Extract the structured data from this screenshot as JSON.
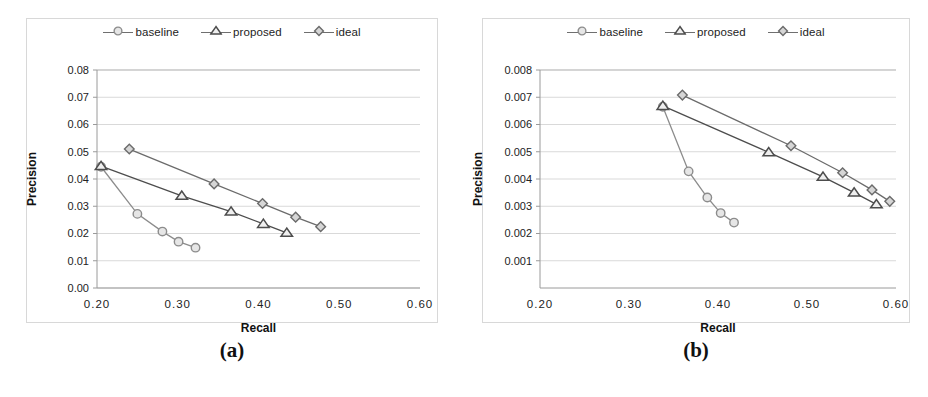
{
  "figure": {
    "panels": [
      {
        "caption": "(a)",
        "legend": [
          {
            "label": "baseline",
            "marker": "circle",
            "color": "#8c8c8c"
          },
          {
            "label": "proposed",
            "marker": "triangle",
            "color": "#4d4d4d"
          },
          {
            "label": "ideal",
            "marker": "diamond",
            "color": "#6b6b6b"
          }
        ],
        "chart_data": {
          "type": "line",
          "title": "",
          "xlabel": "Recall",
          "ylabel": "Precision",
          "xlim": [
            0.2,
            0.6
          ],
          "ylim": [
            0.0,
            0.08
          ],
          "xticks": [
            "0.20",
            "0.30",
            "0.40",
            "0.50",
            "0.60"
          ],
          "xtick_values": [
            0.2,
            0.3,
            0.4,
            0.5,
            0.6
          ],
          "yticks": [
            "0.00",
            "0.01",
            "0.02",
            "0.03",
            "0.04",
            "0.05",
            "0.06",
            "0.07",
            "0.08"
          ],
          "ytick_values": [
            0.0,
            0.01,
            0.02,
            0.03,
            0.04,
            0.05,
            0.06,
            0.07,
            0.08
          ],
          "grid": "horizontal",
          "legend_position": "top-center",
          "series": [
            {
              "name": "baseline",
              "marker": "circle",
              "color": "#8c8c8c",
              "x": [
                0.205,
                0.25,
                0.281,
                0.301,
                0.322
              ],
              "y": [
                0.0445,
                0.0272,
                0.0207,
                0.017,
                0.0148
              ]
            },
            {
              "name": "proposed",
              "marker": "triangle",
              "color": "#4d4d4d",
              "x": [
                0.205,
                0.305,
                0.366,
                0.406,
                0.435
              ],
              "y": [
                0.0447,
                0.0338,
                0.028,
                0.0235,
                0.0202
              ]
            },
            {
              "name": "ideal",
              "marker": "diamond",
              "color": "#6b6b6b",
              "x": [
                0.24,
                0.345,
                0.405,
                0.446,
                0.477
              ],
              "y": [
                0.051,
                0.0382,
                0.031,
                0.026,
                0.0225
              ]
            }
          ]
        }
      },
      {
        "caption": "(b)",
        "legend": [
          {
            "label": "baseline",
            "marker": "circle",
            "color": "#8c8c8c"
          },
          {
            "label": "proposed",
            "marker": "triangle",
            "color": "#4d4d4d"
          },
          {
            "label": "ideal",
            "marker": "diamond",
            "color": "#6b6b6b"
          }
        ],
        "chart_data": {
          "type": "line",
          "title": "",
          "xlabel": "Recall",
          "ylabel": "Precision",
          "xlim": [
            0.2,
            0.6
          ],
          "ylim": [
            0.0,
            0.008
          ],
          "xticks": [
            "0.20",
            "0.30",
            "0.40",
            "0.50",
            "0.60"
          ],
          "xtick_values": [
            0.2,
            0.3,
            0.4,
            0.5,
            0.6
          ],
          "yticks": [
            "0.001",
            "0.002",
            "0.003",
            "0.004",
            "0.005",
            "0.006",
            "0.007",
            "0.008"
          ],
          "ytick_values": [
            0.001,
            0.002,
            0.003,
            0.004,
            0.005,
            0.006,
            0.007,
            0.008
          ],
          "grid": "horizontal",
          "legend_position": "top-center",
          "series": [
            {
              "name": "baseline",
              "marker": "circle",
              "color": "#8c8c8c",
              "x": [
                0.338,
                0.367,
                0.388,
                0.403,
                0.418
              ],
              "y": [
                0.00665,
                0.00428,
                0.00332,
                0.00275,
                0.0024
              ]
            },
            {
              "name": "proposed",
              "marker": "triangle",
              "color": "#4d4d4d",
              "x": [
                0.338,
                0.457,
                0.518,
                0.553,
                0.578
              ],
              "y": [
                0.00668,
                0.00498,
                0.00408,
                0.0035,
                0.00307
              ]
            },
            {
              "name": "ideal",
              "marker": "diamond",
              "color": "#6b6b6b",
              "x": [
                0.36,
                0.482,
                0.54,
                0.573,
                0.593
              ],
              "y": [
                0.00708,
                0.00522,
                0.00423,
                0.0036,
                0.00318
              ]
            }
          ]
        }
      }
    ]
  },
  "colors": {
    "grid": "#d9d9d9",
    "axis": "#a6a6a6",
    "text": "#1a1a1a",
    "background": "#ffffff"
  }
}
